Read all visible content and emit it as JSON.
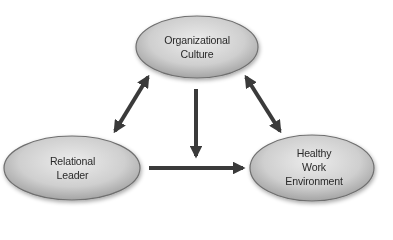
{
  "diagram": {
    "nodes": [
      {
        "id": "organizational-culture",
        "lines": [
          "Organizational",
          "Culture"
        ]
      },
      {
        "id": "relational-leader",
        "lines": [
          "Relational",
          "Leader"
        ]
      },
      {
        "id": "healthy-work-environment",
        "lines": [
          "Healthy",
          "Work",
          "Environment"
        ]
      }
    ],
    "edges": [
      {
        "from": "organizational-culture",
        "to": "relational-leader",
        "type": "bidirectional"
      },
      {
        "from": "organizational-culture",
        "to": "healthy-work-environment",
        "type": "bidirectional"
      },
      {
        "from": "organizational-culture",
        "to": "healthy-work-environment-path",
        "type": "down-arrow"
      },
      {
        "from": "relational-leader",
        "to": "healthy-work-environment",
        "type": "unidirectional"
      }
    ],
    "colors": {
      "ellipse_fill_center": "#e6e6e6",
      "ellipse_fill_edge": "#a9a9a9",
      "ellipse_stroke": "#6f6f6f",
      "arrow": "#3a3a3a"
    }
  }
}
